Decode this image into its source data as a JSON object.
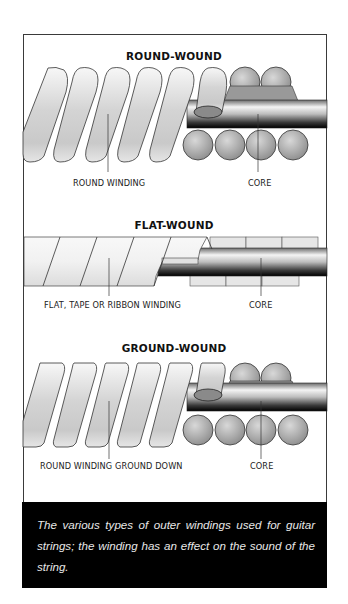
{
  "figure": {
    "sections": [
      {
        "id": "round-wound",
        "title": "ROUND-WOUND",
        "labels": {
          "winding": "ROUND WINDING",
          "core": "CORE"
        }
      },
      {
        "id": "flat-wound",
        "title": "FLAT-WOUND",
        "labels": {
          "winding": "FLAT, TAPE OR RIBBON WINDING",
          "core": "CORE"
        }
      },
      {
        "id": "ground-wound",
        "title": "GROUND-WOUND",
        "labels": {
          "winding": "ROUND WINDING GROUND DOWN",
          "core": "CORE"
        }
      }
    ],
    "colors": {
      "frame_border": "#3a3a3a",
      "caption_bg": "#000000",
      "caption_text": "#e8e8e8",
      "winding_light": "#f2f2f2",
      "winding_shade": "#c8c8c8",
      "core_ball": "#a8a8a8",
      "core_rod_dark": "#111111"
    }
  },
  "caption": {
    "text": "The various types of outer windings used for guitar strings; the winding has an effect on the sound of the string."
  }
}
